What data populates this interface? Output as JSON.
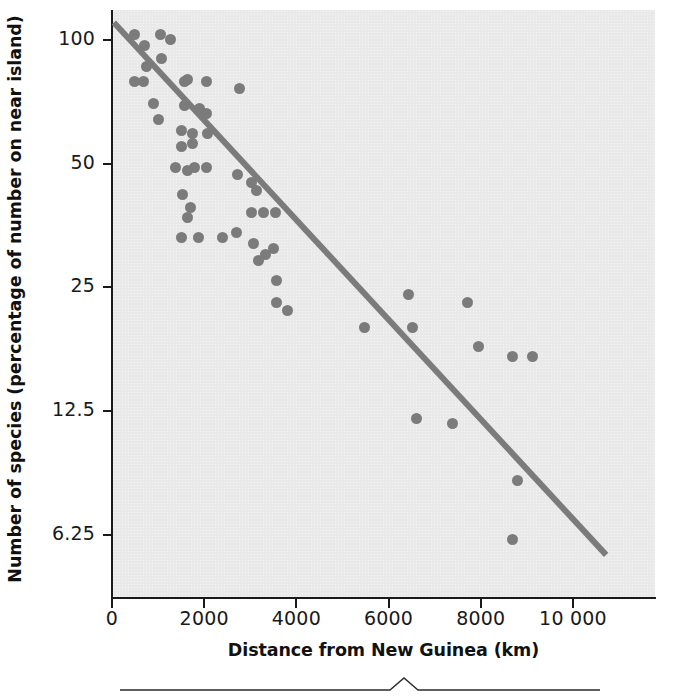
{
  "figure": {
    "background_color": "#ffffff",
    "plot_background_color": "#e9e9e9",
    "point_color": "#7b7b7b",
    "line_color": "#7b7b7b",
    "axis_color": "#1a1a1a"
  },
  "chart_data": {
    "type": "scatter",
    "title": "",
    "xlabel": "Distance from New Guinea (km)",
    "ylabel": "Number of species (percentage of number on near island)",
    "xlim": [
      0,
      11780
    ],
    "ylim": [
      4.4,
      118
    ],
    "yscale": "log",
    "xscale": "linear",
    "grid": false,
    "legend": null,
    "xticks": [
      0,
      2000,
      4000,
      6000,
      8000,
      10000
    ],
    "xticklabels": [
      "0",
      "2000",
      "4000",
      "6000",
      "8000",
      "10 000"
    ],
    "yticks": [
      100,
      50,
      25,
      12.5,
      6.25
    ],
    "yticklabels": [
      "100",
      "50",
      "25",
      "12.5",
      "6.25"
    ],
    "series": [
      {
        "name": "islands",
        "marker": "circle",
        "points": [
          [
            480,
            103
          ],
          [
            700,
            97
          ],
          [
            740,
            86
          ],
          [
            1060,
            103
          ],
          [
            1080,
            90
          ],
          [
            1260,
            100
          ],
          [
            480,
            79
          ],
          [
            680,
            79
          ],
          [
            1580,
            79
          ],
          [
            1640,
            80
          ],
          [
            2060,
            79
          ],
          [
            2760,
            76
          ],
          [
            900,
            70
          ],
          [
            1000,
            64
          ],
          [
            1580,
            69
          ],
          [
            1900,
            68
          ],
          [
            2060,
            66
          ],
          [
            1500,
            60
          ],
          [
            1750,
            59
          ],
          [
            2080,
            59
          ],
          [
            1500,
            55
          ],
          [
            1740,
            56
          ],
          [
            1380,
            49
          ],
          [
            1640,
            48
          ],
          [
            1780,
            49
          ],
          [
            2060,
            49
          ],
          [
            2720,
            47
          ],
          [
            3020,
            45
          ],
          [
            3140,
            43
          ],
          [
            1520,
            42
          ],
          [
            1700,
            39
          ],
          [
            3030,
            38
          ],
          [
            3280,
            38
          ],
          [
            3540,
            38
          ],
          [
            1640,
            37
          ],
          [
            1500,
            33
          ],
          [
            1880,
            33
          ],
          [
            2400,
            33
          ],
          [
            2700,
            34
          ],
          [
            3080,
            32
          ],
          [
            3500,
            31
          ],
          [
            3180,
            29
          ],
          [
            3330,
            30
          ],
          [
            3560,
            26
          ],
          [
            6440,
            24
          ],
          [
            7720,
            23
          ],
          [
            3570,
            23
          ],
          [
            3800,
            22
          ],
          [
            5480,
            20
          ],
          [
            6520,
            20
          ],
          [
            7960,
            18
          ],
          [
            8680,
            17
          ],
          [
            9120,
            17
          ],
          [
            6600,
            12
          ],
          [
            7380,
            11.7
          ],
          [
            8800,
            8.5
          ],
          [
            8680,
            6.1
          ]
        ]
      }
    ],
    "trendline": {
      "name": "regression-line",
      "x0": 40,
      "y0": 110,
      "x1": 10720,
      "y1": 5.6
    }
  },
  "ornament": {
    "caret_label": "decorative-rule"
  }
}
